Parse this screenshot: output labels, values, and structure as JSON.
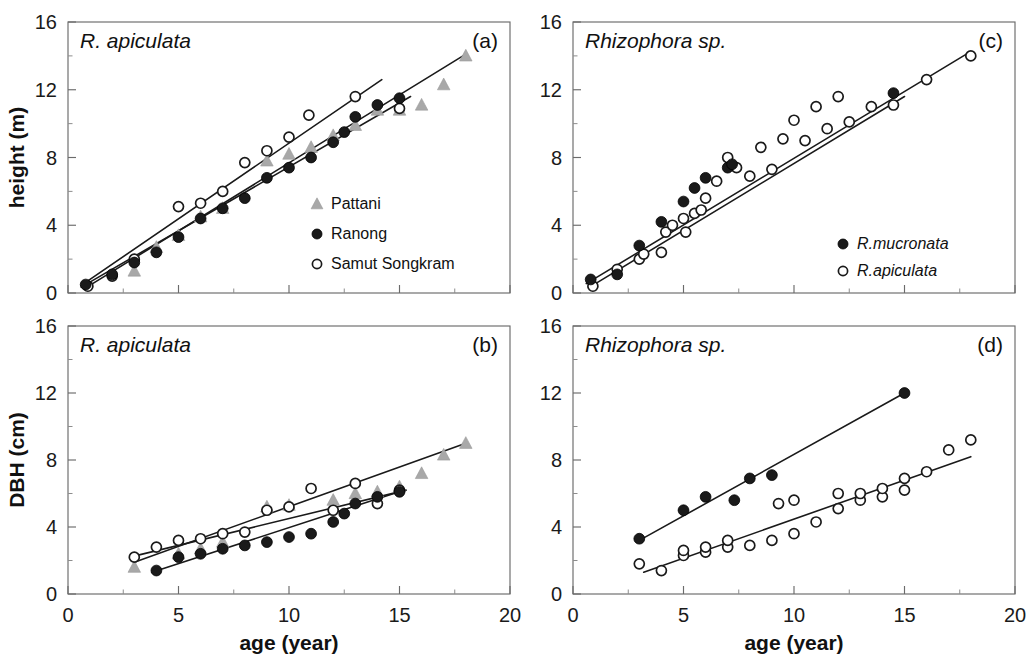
{
  "figure": {
    "width": 1034,
    "height": 669,
    "background": "#ffffff",
    "marker_colors": {
      "filled_circle": "#1a1a1a",
      "open_circle": "#ffffff",
      "triangle": "#a8a8a8",
      "fit_line": "#1a1a1a",
      "axis": "#6b6b6b"
    }
  },
  "axes": {
    "x_title": "age (year)",
    "x_ticks": [
      0,
      5,
      10,
      15,
      20
    ],
    "x_lim": [
      0,
      20
    ],
    "y_ticks": [
      0,
      4,
      8,
      12,
      16
    ],
    "y_lim": [
      0,
      16
    ],
    "y_title_top": "height (m)",
    "y_title_bottom": "DBH (cm)",
    "grid": "off",
    "minor_ticks": true
  },
  "chart_data": [
    {
      "type": "scatter",
      "panel": "a",
      "panel_letter": "(a)",
      "title": "R. apiculata",
      "title_style": "italic",
      "xlabel": "age (year)",
      "ylabel": "height (m)",
      "xlim": [
        0,
        20
      ],
      "ylim": [
        0,
        16
      ],
      "legend_position": "bottom-right",
      "series": [
        {
          "name": "Pattani",
          "marker": "triangle",
          "color": "#a8a8a8",
          "points": [
            [
              3.0,
              1.3
            ],
            [
              4.0,
              2.7
            ],
            [
              5.0,
              3.4
            ],
            [
              6.0,
              4.5
            ],
            [
              7.0,
              5.0
            ],
            [
              9.0,
              7.8
            ],
            [
              10.0,
              8.2
            ],
            [
              11.0,
              8.6
            ],
            [
              12.0,
              9.3
            ],
            [
              13.0,
              9.9
            ],
            [
              14.0,
              10.8
            ],
            [
              15.0,
              10.8
            ],
            [
              16.0,
              11.1
            ],
            [
              17.0,
              12.3
            ],
            [
              18.0,
              14.0
            ]
          ]
        },
        {
          "name": "Ranong",
          "marker": "filled-circle",
          "color": "#1a1a1a",
          "points": [
            [
              0.8,
              0.5
            ],
            [
              2.0,
              1.1
            ],
            [
              3.0,
              1.8
            ],
            [
              4.0,
              2.4
            ],
            [
              5.0,
              3.3
            ],
            [
              6.0,
              4.4
            ],
            [
              7.0,
              5.0
            ],
            [
              8.0,
              5.6
            ],
            [
              9.0,
              6.8
            ],
            [
              10.0,
              7.4
            ],
            [
              11.0,
              8.0
            ],
            [
              12.0,
              8.9
            ],
            [
              12.5,
              9.5
            ],
            [
              13.0,
              10.4
            ],
            [
              14.0,
              11.1
            ],
            [
              15.0,
              11.5
            ]
          ]
        },
        {
          "name": "Samut Songkram",
          "marker": "open-circle",
          "color": "#ffffff",
          "points": [
            [
              0.9,
              0.4
            ],
            [
              2.0,
              1.0
            ],
            [
              3.0,
              2.0
            ],
            [
              5.0,
              5.1
            ],
            [
              6.0,
              5.3
            ],
            [
              7.0,
              6.0
            ],
            [
              8.0,
              7.7
            ],
            [
              9.0,
              8.4
            ],
            [
              10.0,
              9.2
            ],
            [
              10.9,
              10.5
            ],
            [
              13.0,
              11.6
            ],
            [
              15.0,
              10.9
            ]
          ]
        }
      ],
      "fit_lines": [
        {
          "series": "Samut Songkram",
          "x": [
            0.6,
            14.2
          ],
          "y": [
            0.45,
            12.6
          ]
        },
        {
          "series": "Ranong",
          "x": [
            0.6,
            15.5
          ],
          "y": [
            0.35,
            11.6
          ]
        },
        {
          "series": "Pattani",
          "x": [
            0.8,
            18.0
          ],
          "y": [
            0.3,
            14.1
          ]
        }
      ]
    },
    {
      "type": "scatter",
      "panel": "b",
      "panel_letter": "(b)",
      "title": "R. apiculata",
      "title_style": "italic",
      "xlabel": "age (year)",
      "ylabel": "DBH (cm)",
      "xlim": [
        0,
        20
      ],
      "ylim": [
        0,
        16
      ],
      "legend_position": "none",
      "series": [
        {
          "name": "Pattani",
          "marker": "triangle",
          "color": "#a8a8a8",
          "points": [
            [
              3.0,
              1.6
            ],
            [
              5.0,
              2.4
            ],
            [
              6.0,
              2.7
            ],
            [
              7.0,
              3.1
            ],
            [
              9.0,
              5.2
            ],
            [
              10.0,
              5.3
            ],
            [
              12.0,
              5.6
            ],
            [
              13.0,
              6.0
            ],
            [
              14.0,
              6.1
            ],
            [
              15.0,
              6.4
            ],
            [
              16.0,
              7.2
            ],
            [
              17.0,
              8.3
            ],
            [
              18.0,
              9.0
            ]
          ]
        },
        {
          "name": "Ranong",
          "marker": "filled-circle",
          "color": "#1a1a1a",
          "points": [
            [
              4.0,
              1.4
            ],
            [
              5.0,
              2.2
            ],
            [
              6.0,
              2.4
            ],
            [
              7.0,
              2.7
            ],
            [
              8.0,
              2.9
            ],
            [
              9.0,
              3.1
            ],
            [
              10.0,
              3.4
            ],
            [
              11.0,
              3.6
            ],
            [
              12.0,
              4.3
            ],
            [
              12.5,
              4.8
            ],
            [
              13.0,
              5.4
            ],
            [
              14.0,
              5.8
            ],
            [
              15.0,
              6.1
            ]
          ]
        },
        {
          "name": "Samut Songkram",
          "marker": "open-circle",
          "color": "#ffffff",
          "points": [
            [
              3.0,
              2.2
            ],
            [
              4.0,
              2.8
            ],
            [
              5.0,
              3.2
            ],
            [
              6.0,
              3.3
            ],
            [
              7.0,
              3.6
            ],
            [
              8.0,
              3.7
            ],
            [
              9.0,
              5.0
            ],
            [
              10.0,
              5.2
            ],
            [
              11.0,
              6.3
            ],
            [
              12.0,
              5.0
            ],
            [
              13.0,
              6.6
            ],
            [
              14.0,
              5.4
            ],
            [
              15.0,
              6.2
            ]
          ]
        }
      ],
      "fit_lines": [
        {
          "series": "Samut Songkram",
          "x": [
            2.8,
            15.3
          ],
          "y": [
            2.2,
            6.2
          ]
        },
        {
          "series": "Pattani",
          "x": [
            3.0,
            18.0
          ],
          "y": [
            1.9,
            9.0
          ]
        },
        {
          "series": "Ranong",
          "x": [
            3.8,
            15.2
          ],
          "y": [
            1.3,
            6.2
          ]
        }
      ]
    },
    {
      "type": "scatter",
      "panel": "c",
      "panel_letter": "(c)",
      "title": "Rhizophora sp.",
      "title_style": "italic",
      "xlabel": "age (year)",
      "ylabel": "height (m)",
      "xlim": [
        0,
        20
      ],
      "ylim": [
        0,
        16
      ],
      "legend_position": "bottom-right",
      "series": [
        {
          "name": "R.mucronata",
          "marker": "filled-circle",
          "color": "#1a1a1a",
          "points": [
            [
              0.8,
              0.8
            ],
            [
              2.0,
              1.1
            ],
            [
              3.0,
              2.8
            ],
            [
              4.0,
              4.2
            ],
            [
              5.0,
              5.4
            ],
            [
              5.5,
              6.2
            ],
            [
              6.0,
              6.8
            ],
            [
              7.0,
              7.4
            ],
            [
              7.2,
              7.6
            ],
            [
              14.5,
              11.8
            ]
          ]
        },
        {
          "name": "R.apiculata",
          "marker": "open-circle",
          "color": "#ffffff",
          "points": [
            [
              0.9,
              0.4
            ],
            [
              2.0,
              1.4
            ],
            [
              3.0,
              2.0
            ],
            [
              3.2,
              2.3
            ],
            [
              4.0,
              2.4
            ],
            [
              4.2,
              3.6
            ],
            [
              4.5,
              4.0
            ],
            [
              5.0,
              4.4
            ],
            [
              5.1,
              3.6
            ],
            [
              5.5,
              4.7
            ],
            [
              5.8,
              4.9
            ],
            [
              6.0,
              5.6
            ],
            [
              6.5,
              6.6
            ],
            [
              7.0,
              8.0
            ],
            [
              7.4,
              7.4
            ],
            [
              8.0,
              6.9
            ],
            [
              8.5,
              8.6
            ],
            [
              9.0,
              7.3
            ],
            [
              9.5,
              9.1
            ],
            [
              10.0,
              10.2
            ],
            [
              10.5,
              9.0
            ],
            [
              11.0,
              11.0
            ],
            [
              11.5,
              9.7
            ],
            [
              12.0,
              11.6
            ],
            [
              12.5,
              10.1
            ],
            [
              13.5,
              11.0
            ],
            [
              14.5,
              11.1
            ],
            [
              16.0,
              12.6
            ],
            [
              18.0,
              14.0
            ]
          ]
        }
      ],
      "fit_lines": [
        {
          "series": "R.mucronata",
          "x": [
            0.6,
            17.8
          ],
          "y": [
            0.55,
            14.1
          ]
        },
        {
          "series": "R.apiculata",
          "x": [
            0.7,
            15.0
          ],
          "y": [
            0.3,
            11.6
          ]
        }
      ]
    },
    {
      "type": "scatter",
      "panel": "d",
      "panel_letter": "(d)",
      "title": "Rhizophora sp.",
      "title_style": "italic",
      "xlabel": "age (year)",
      "ylabel": "DBH (cm)",
      "xlim": [
        0,
        20
      ],
      "ylim": [
        0,
        16
      ],
      "legend_position": "none",
      "series": [
        {
          "name": "R.mucronata",
          "marker": "filled-circle",
          "color": "#1a1a1a",
          "points": [
            [
              3.0,
              3.3
            ],
            [
              5.0,
              5.0
            ],
            [
              6.0,
              5.8
            ],
            [
              7.3,
              5.6
            ],
            [
              8.0,
              6.9
            ],
            [
              9.0,
              7.1
            ],
            [
              15.0,
              12.0
            ]
          ]
        },
        {
          "name": "R.apiculata",
          "marker": "open-circle",
          "color": "#ffffff",
          "points": [
            [
              3.0,
              1.8
            ],
            [
              4.0,
              1.4
            ],
            [
              5.0,
              2.3
            ],
            [
              5.0,
              2.6
            ],
            [
              6.0,
              2.5
            ],
            [
              6.0,
              2.8
            ],
            [
              7.0,
              2.8
            ],
            [
              7.0,
              3.2
            ],
            [
              8.0,
              2.9
            ],
            [
              9.0,
              3.2
            ],
            [
              9.3,
              5.4
            ],
            [
              10.0,
              3.6
            ],
            [
              10.0,
              5.6
            ],
            [
              11.0,
              4.3
            ],
            [
              12.0,
              5.1
            ],
            [
              12.0,
              6.0
            ],
            [
              13.0,
              5.6
            ],
            [
              13.0,
              6.0
            ],
            [
              14.0,
              5.8
            ],
            [
              14.0,
              6.3
            ],
            [
              15.0,
              6.2
            ],
            [
              15.0,
              6.9
            ],
            [
              16.0,
              7.3
            ],
            [
              17.0,
              8.6
            ],
            [
              18.0,
              9.2
            ]
          ]
        }
      ],
      "fit_lines": [
        {
          "series": "R.mucronata",
          "x": [
            3.0,
            15.0
          ],
          "y": [
            3.2,
            12.0
          ]
        },
        {
          "series": "R.apiculata",
          "x": [
            3.2,
            18.0
          ],
          "y": [
            1.3,
            8.2
          ]
        }
      ]
    }
  ]
}
